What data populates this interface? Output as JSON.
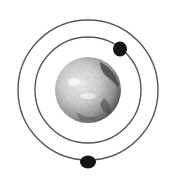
{
  "diagram": {
    "planet": {
      "cx": 88,
      "cy": 90,
      "r": 33,
      "shading": "#9a9a9a",
      "highlight": "#f2f2f2",
      "shadow": "#3a3a3a"
    },
    "orbits": [
      {
        "name": "inner-orbit",
        "cx": 88,
        "cy": 90,
        "r": 53,
        "stroke": "#555555"
      },
      {
        "name": "outer-orbit",
        "cx": 88,
        "cy": 90,
        "r": 70,
        "stroke": "#555555"
      }
    ],
    "moons": [
      {
        "name": "moon-upper-right",
        "cx": 120,
        "cy": 49,
        "r": 7,
        "fill": "#141414"
      },
      {
        "name": "moon-bottom",
        "cx": 88,
        "cy": 162,
        "r": 7,
        "fill": "#141414"
      }
    ]
  }
}
